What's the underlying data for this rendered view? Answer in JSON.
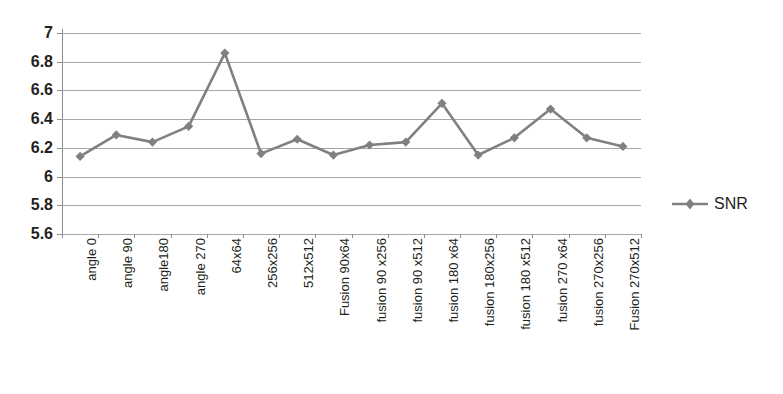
{
  "chart_data": {
    "type": "line",
    "title": "",
    "xlabel": "",
    "ylabel": "",
    "ylim": [
      5.6,
      7.0
    ],
    "ytick_step": 0.2,
    "yticks": [
      "7",
      "6.8",
      "6.6",
      "6.4",
      "6.2",
      "6",
      "5.8",
      "5.6"
    ],
    "ytick_values": [
      7,
      6.8,
      6.6,
      6.4,
      6.2,
      6,
      5.8,
      5.6
    ],
    "grid": true,
    "legend_position": "right",
    "categories": [
      "angle 0",
      "angle 90",
      "angle180",
      "angle 270",
      "64x64",
      "256x256",
      "512x512",
      "Fusion 90x64",
      "fusion 90 x256",
      "fusion 90 x512",
      "fusion 180 x64",
      "fusion 180x256",
      "fusion 180 x512",
      "fusion 270 x64",
      "fusion 270x256",
      "Fusion 270x512"
    ],
    "series": [
      {
        "name": "SNR",
        "color": "#808080",
        "marker": "diamond",
        "values": [
          6.14,
          6.29,
          6.24,
          6.35,
          6.86,
          6.16,
          6.26,
          6.15,
          6.22,
          6.24,
          6.51,
          6.15,
          6.27,
          6.47,
          6.27,
          6.21
        ]
      }
    ]
  },
  "legend": {
    "entries": [
      {
        "label": "SNR",
        "color": "#808080"
      }
    ]
  },
  "colors": {
    "series": "#808080",
    "gridline": "#a7a7a7",
    "axis": "#8d8d8d",
    "text": "#231f20",
    "background": "#ffffff"
  }
}
